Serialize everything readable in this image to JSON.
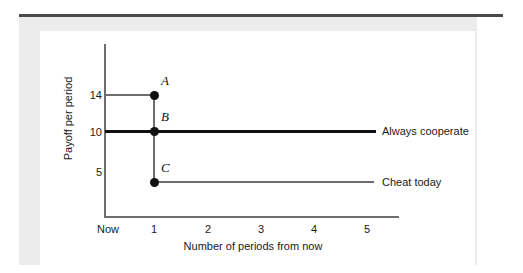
{
  "figure": {
    "title": "",
    "background": "#ffffff",
    "band_color": "#ececed",
    "rule_color": "#4a4a4a"
  },
  "axes": {
    "x_title": "Number of periods from now",
    "y_title": "Payoff per period",
    "x_ticks": [
      "Now",
      "1",
      "2",
      "3",
      "4",
      "5"
    ],
    "y_ticks": [
      "14",
      "10",
      "5"
    ]
  },
  "points": [
    {
      "label": "A",
      "x": 1,
      "y": 14
    },
    {
      "label": "B",
      "x": 1,
      "y": 10
    },
    {
      "label": "C",
      "x": 1,
      "y": 4.3
    }
  ],
  "series_labels": {
    "cooperate": "Always cooperate",
    "cheat": "Cheat today"
  },
  "colors": {
    "cooperate_line": "#111111",
    "cheat_line": "#6e6e6e",
    "axis": "#6e6e6e",
    "point": "#111111"
  },
  "chart_data": {
    "type": "line",
    "title": "",
    "xlabel": "Number of periods from now",
    "ylabel": "Payoff per period",
    "xlim": [
      0,
      5.6
    ],
    "ylim": [
      0,
      17
    ],
    "xticklabels": [
      "Now",
      "1",
      "2",
      "3",
      "4",
      "5"
    ],
    "xtickvalues": [
      0,
      1,
      2,
      3,
      4,
      5
    ],
    "yticklabels": [
      "14",
      "10",
      "5"
    ],
    "ytickvalues": [
      14,
      10,
      5
    ],
    "grid": false,
    "legend": "right-of-axes (inline annotations)",
    "series": [
      {
        "name": "Always cooperate",
        "style": "thick-black",
        "x": [
          0,
          5
        ],
        "values": [
          10,
          10
        ]
      },
      {
        "name": "Cheat today",
        "style": "thin-gray",
        "x": [
          1,
          5
        ],
        "values": [
          4.3,
          4.3
        ]
      },
      {
        "name": "Cheat-today period-1 payoff (reference at 14)",
        "style": "thin-gray",
        "x": [
          0,
          1
        ],
        "values": [
          14,
          14
        ]
      },
      {
        "name": "Payoff drop at period 1 (A to C)",
        "style": "thin-gray-vertical",
        "x": [
          1,
          1
        ],
        "values": [
          14,
          4.3
        ]
      }
    ],
    "annotations": [
      {
        "text": "A",
        "x": 1,
        "y": 14,
        "note": "payoff from cheating today"
      },
      {
        "text": "B",
        "x": 1,
        "y": 10,
        "note": "payoff from always cooperating"
      },
      {
        "text": "C",
        "x": 1,
        "y": 4.3,
        "note": "payoff after cheating, punished"
      },
      {
        "text": "Always cooperate",
        "x": 5.1,
        "y": 10
      },
      {
        "text": "Cheat today",
        "x": 5.1,
        "y": 4.3
      }
    ]
  }
}
